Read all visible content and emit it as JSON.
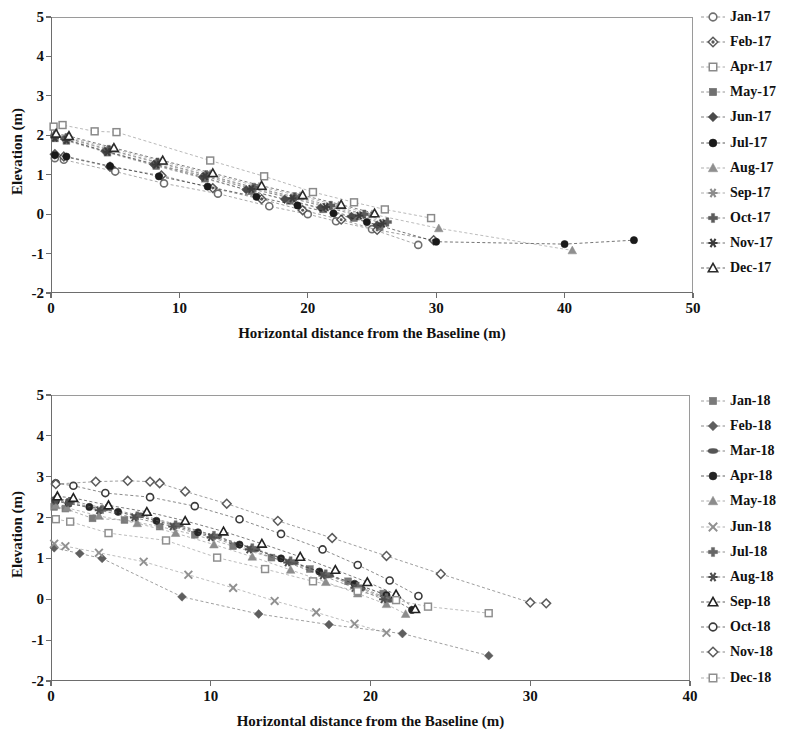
{
  "chart_data": [
    {
      "type": "scatter",
      "id": "top",
      "title": "",
      "xlabel": "Horizontal distance from the Baseline (m)",
      "ylabel": "Elevation (m)",
      "xlim": [
        0,
        50
      ],
      "ylim": [
        -2,
        5
      ],
      "xticks": [
        0,
        10,
        20,
        30,
        40,
        50
      ],
      "yticks": [
        -2,
        -1,
        0,
        1,
        2,
        3,
        4,
        5
      ],
      "grid": false,
      "legend_position": "right",
      "series": [
        {
          "name": "Jan-17",
          "marker": "circle-open",
          "color": "#6f6f6f",
          "x": [
            0.3,
            1.0,
            5.0,
            8.8,
            13.0,
            17.0,
            20.0,
            22.2,
            25.0,
            28.6
          ],
          "y": [
            1.42,
            1.38,
            1.08,
            0.78,
            0.52,
            0.2,
            0.0,
            -0.18,
            -0.38,
            -0.78
          ]
        },
        {
          "name": "Feb-17",
          "marker": "diamond-dot",
          "color": "#5a5a5a",
          "x": [
            0.3,
            1.0,
            4.6,
            8.6,
            12.6,
            16.4,
            19.6,
            22.6,
            25.4,
            29.8
          ],
          "y": [
            1.52,
            1.46,
            1.2,
            0.98,
            0.66,
            0.38,
            0.1,
            -0.14,
            -0.4,
            -0.66
          ]
        },
        {
          "name": "Apr-17",
          "marker": "square-open",
          "color": "#8a8a8a",
          "x": [
            0.2,
            0.9,
            3.4,
            5.1,
            12.4,
            16.6,
            20.4,
            23.6,
            26.0,
            29.6
          ],
          "y": [
            2.22,
            2.26,
            2.1,
            2.08,
            1.36,
            0.96,
            0.56,
            0.3,
            0.12,
            -0.1
          ]
        },
        {
          "name": "May-17",
          "marker": "square-filled",
          "color": "#707070",
          "x": [
            0.3,
            1.2,
            4.4,
            8.2,
            12.0,
            15.6,
            18.6,
            21.2,
            23.6,
            25.6
          ],
          "y": [
            1.92,
            1.86,
            1.56,
            1.22,
            0.9,
            0.58,
            0.34,
            0.12,
            -0.1,
            -0.32
          ]
        },
        {
          "name": "Jun-17",
          "marker": "diamond-filled",
          "color": "#4a4a4a",
          "x": [
            0.3,
            1.1,
            4.2,
            8.0,
            11.8,
            15.2,
            18.2,
            21.0,
            23.4,
            25.4
          ],
          "y": [
            1.96,
            1.9,
            1.6,
            1.26,
            0.94,
            0.62,
            0.38,
            0.16,
            -0.06,
            -0.28
          ]
        },
        {
          "name": "Jul-17",
          "marker": "circle-filled",
          "color": "#1a1a1a",
          "x": [
            0.3,
            1.2,
            4.6,
            8.4,
            12.2,
            16.0,
            19.2,
            22.0,
            24.6,
            30.0,
            40.0,
            45.4
          ],
          "y": [
            1.5,
            1.46,
            1.22,
            0.96,
            0.7,
            0.44,
            0.22,
            0.02,
            -0.2,
            -0.7,
            -0.76,
            -0.66
          ]
        },
        {
          "name": "Aug-17",
          "marker": "triangle-filled",
          "color": "#8f8f8f",
          "x": [
            0.3,
            1.3,
            4.8,
            8.6,
            12.4,
            16.2,
            19.4,
            22.4,
            25.0,
            30.2,
            40.6
          ],
          "y": [
            2.02,
            1.96,
            1.66,
            1.34,
            1.02,
            0.7,
            0.46,
            0.22,
            0.0,
            -0.36,
            -0.92
          ]
        },
        {
          "name": "Sep-17",
          "marker": "star6",
          "color": "#8d8d8d",
          "x": [
            0.3,
            1.2,
            4.5,
            8.3,
            12.1,
            15.8,
            18.9,
            21.6,
            24.2,
            26.0
          ],
          "y": [
            1.98,
            1.92,
            1.62,
            1.3,
            0.98,
            0.66,
            0.42,
            0.2,
            -0.02,
            -0.22
          ]
        },
        {
          "name": "Oct-17",
          "marker": "plus-filled",
          "color": "#5c5c5c",
          "x": [
            0.3,
            1.2,
            4.5,
            8.3,
            12.1,
            15.8,
            19.0,
            21.8,
            24.4,
            26.2
          ],
          "y": [
            2.0,
            1.94,
            1.64,
            1.32,
            1.0,
            0.68,
            0.44,
            0.22,
            0.0,
            -0.2
          ]
        },
        {
          "name": "Nov-17",
          "marker": "star6-dark",
          "color": "#3c3c3c",
          "x": [
            0.3,
            1.2,
            4.4,
            8.2,
            12.0,
            15.6,
            18.8,
            21.4,
            24.0,
            25.8
          ],
          "y": [
            1.94,
            1.88,
            1.58,
            1.26,
            0.96,
            0.64,
            0.4,
            0.18,
            -0.04,
            -0.24
          ]
        },
        {
          "name": "Dec-17",
          "marker": "triangle-open",
          "color": "#2b2b2b",
          "x": [
            0.4,
            1.4,
            4.9,
            8.7,
            12.6,
            16.4,
            19.6,
            22.6,
            25.2
          ],
          "y": [
            2.04,
            1.98,
            1.68,
            1.36,
            1.04,
            0.72,
            0.48,
            0.24,
            0.02
          ]
        }
      ]
    },
    {
      "type": "scatter",
      "id": "bottom",
      "title": "",
      "xlabel": "Horizontal distance from the Baseline (m)",
      "ylabel": "Elevation (m)",
      "xlim": [
        0,
        40
      ],
      "ylim": [
        -2,
        5
      ],
      "xticks": [
        0,
        10,
        20,
        30,
        40
      ],
      "yticks": [
        -2,
        -1,
        0,
        1,
        2,
        3,
        4,
        5
      ],
      "grid": false,
      "legend_position": "right",
      "series": [
        {
          "name": "Jan-18",
          "marker": "square-filled",
          "color": "#7a7a7a",
          "x": [
            0.2,
            0.9,
            2.6,
            4.6,
            6.8,
            9.0,
            11.4,
            13.8,
            16.2,
            18.6,
            20.8
          ],
          "y": [
            2.26,
            2.22,
            1.98,
            1.94,
            1.78,
            1.58,
            1.3,
            1.02,
            0.74,
            0.44,
            0.14
          ]
        },
        {
          "name": "Feb-18",
          "marker": "diamond-filled",
          "color": "#5e5e5e",
          "x": [
            0.2,
            1.8,
            3.2,
            8.2,
            13.0,
            17.4,
            22.0,
            27.4
          ],
          "y": [
            1.26,
            1.12,
            1.0,
            0.06,
            -0.36,
            -0.62,
            -0.84,
            -1.38
          ]
        },
        {
          "name": "Mar-18",
          "marker": "ellipse-filled",
          "color": "#555555",
          "x": [
            0.3,
            1.2,
            3.4,
            5.6,
            8.0,
            10.4,
            12.8,
            15.2,
            17.4,
            19.4,
            21.2
          ],
          "y": [
            2.46,
            2.42,
            2.22,
            2.06,
            1.82,
            1.54,
            1.22,
            0.9,
            0.58,
            0.26,
            -0.02
          ]
        },
        {
          "name": "Apr-18",
          "marker": "circle-filled",
          "color": "#242424",
          "x": [
            0.3,
            1.1,
            2.4,
            4.2,
            6.6,
            9.2,
            11.8,
            14.4,
            16.8,
            19.0,
            21.0,
            22.6
          ],
          "y": [
            2.4,
            2.34,
            2.26,
            2.14,
            1.92,
            1.64,
            1.34,
            1.0,
            0.68,
            0.38,
            0.1,
            -0.26
          ]
        },
        {
          "name": "May-18",
          "marker": "triangle-filled",
          "color": "#8c8c8c",
          "x": [
            0.3,
            1.0,
            3.0,
            5.4,
            7.8,
            10.2,
            12.6,
            15.0,
            17.2,
            19.2,
            21.0,
            22.2
          ],
          "y": [
            2.3,
            2.24,
            2.04,
            1.86,
            1.62,
            1.34,
            1.04,
            0.72,
            0.42,
            0.14,
            -0.12,
            -0.36
          ]
        },
        {
          "name": "Jun-18",
          "marker": "xcross",
          "color": "#909090",
          "x": [
            0.2,
            0.9,
            3.0,
            5.8,
            8.6,
            11.4,
            14.0,
            16.6,
            19.0,
            21.0
          ],
          "y": [
            1.36,
            1.3,
            1.14,
            0.92,
            0.6,
            0.28,
            -0.04,
            -0.32,
            -0.6,
            -0.82
          ]
        },
        {
          "name": "Jul-18",
          "marker": "plus-filled",
          "color": "#666666",
          "x": [
            0.3,
            1.2,
            3.2,
            5.4,
            7.8,
            10.2,
            12.6,
            15.0,
            17.2,
            19.2,
            21.0
          ],
          "y": [
            2.44,
            2.38,
            2.2,
            2.04,
            1.82,
            1.56,
            1.26,
            0.94,
            0.62,
            0.32,
            0.04
          ]
        },
        {
          "name": "Aug-18",
          "marker": "star6-dark",
          "color": "#4f4f4f",
          "x": [
            0.3,
            1.1,
            3.0,
            5.2,
            7.6,
            10.0,
            12.4,
            14.8,
            17.0,
            19.0,
            20.8
          ],
          "y": [
            2.42,
            2.36,
            2.18,
            2.0,
            1.78,
            1.52,
            1.22,
            0.9,
            0.58,
            0.28,
            0.0
          ]
        },
        {
          "name": "Sep-18",
          "marker": "triangle-open",
          "color": "#232323",
          "x": [
            0.4,
            1.4,
            3.6,
            6.0,
            8.4,
            10.8,
            13.2,
            15.6,
            17.8,
            19.8,
            21.6,
            22.8
          ],
          "y": [
            2.52,
            2.48,
            2.3,
            2.14,
            1.92,
            1.66,
            1.36,
            1.04,
            0.72,
            0.42,
            0.12,
            -0.24
          ]
        },
        {
          "name": "Oct-18",
          "marker": "circle-open",
          "color": "#3a3a3a",
          "x": [
            0.3,
            1.4,
            3.4,
            6.2,
            9.0,
            11.8,
            14.4,
            17.0,
            19.2,
            21.2,
            23.0
          ],
          "y": [
            2.84,
            2.78,
            2.6,
            2.5,
            2.28,
            1.96,
            1.6,
            1.22,
            0.84,
            0.46,
            0.08
          ]
        },
        {
          "name": "Nov-18",
          "marker": "diamond-open",
          "color": "#5b5b5b",
          "x": [
            0.3,
            2.8,
            4.8,
            6.2,
            6.8,
            8.4,
            11.0,
            14.2,
            17.6,
            21.0,
            24.4,
            30.0,
            31.0
          ],
          "y": [
            2.82,
            2.88,
            2.9,
            2.88,
            2.84,
            2.64,
            2.34,
            1.92,
            1.5,
            1.06,
            0.62,
            -0.08,
            -0.1
          ]
        },
        {
          "name": "Dec-18",
          "marker": "square-open",
          "color": "#8f8f8f",
          "x": [
            0.3,
            1.2,
            3.6,
            7.2,
            10.4,
            13.4,
            16.4,
            19.2,
            21.6,
            23.6,
            27.4
          ],
          "y": [
            1.96,
            1.9,
            1.62,
            1.44,
            1.02,
            0.74,
            0.44,
            0.2,
            -0.02,
            -0.18,
            -0.34
          ]
        }
      ]
    }
  ]
}
